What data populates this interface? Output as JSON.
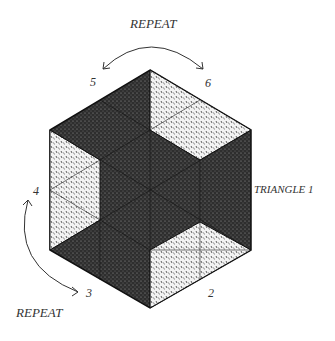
{
  "labels": {
    "repeat_top": "REPEAT",
    "repeat_bottom": "REPEAT",
    "triangle": "TRIANGLE 1",
    "n2": "2",
    "n3": "3",
    "n4": "4",
    "n5": "5",
    "n6": "6"
  },
  "colors": {
    "dark": "#3a3a3a",
    "light": "#d8d8d8",
    "line": "#111111"
  }
}
